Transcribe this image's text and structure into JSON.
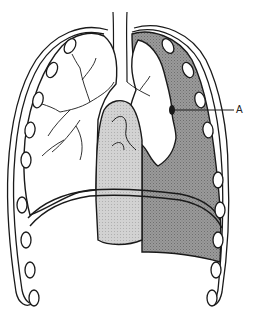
{
  "diagram": {
    "labels": [
      {
        "id": "A",
        "text": "A",
        "x": 237,
        "y": 106
      }
    ],
    "colors": {
      "outline": "#1a1a1a",
      "background": "#ffffff",
      "collapsed_side_fill": "#8f8f8f",
      "heart_fill": "#c8c8c8",
      "lung_fill": "#ffffff"
    }
  }
}
